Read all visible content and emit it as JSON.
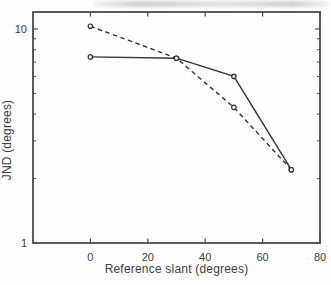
{
  "figure": {
    "background": "#fefefe",
    "ink_color": "#333333",
    "frame_color": "#4a4a4a",
    "marker_fill": "#ffffff"
  },
  "chart_data": {
    "type": "line",
    "title": "",
    "xlabel": "Reference slant (degrees)",
    "ylabel": "JND (degrees)",
    "x": [
      0,
      30,
      50,
      70
    ],
    "series": [
      {
        "name": "solid-series",
        "style": "solid",
        "marker": "open-circle",
        "values": [
          7.4,
          7.3,
          6.0,
          2.2
        ]
      },
      {
        "name": "dashed-series",
        "style": "dashed",
        "marker": "open-circle",
        "values": [
          10.3,
          7.3,
          4.3,
          2.2
        ]
      }
    ],
    "x_axis": {
      "scale": "linear",
      "min": -20,
      "max": 80,
      "major_ticks": [
        0,
        20,
        40,
        60,
        80
      ],
      "tick_labels": [
        "0",
        "20",
        "40",
        "60",
        "80"
      ]
    },
    "y_axis": {
      "scale": "log",
      "min": 1,
      "max": 12,
      "major_ticks": [
        1,
        10
      ],
      "tick_labels": [
        "1",
        "10"
      ],
      "minor_ticks": [
        2,
        3,
        4,
        5,
        6,
        7,
        8,
        9
      ]
    },
    "grid": false,
    "legend": null
  }
}
